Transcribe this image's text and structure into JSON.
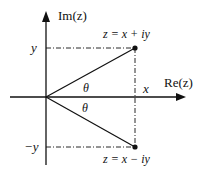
{
  "diagram": {
    "type": "complex-plane-conjugate",
    "axes": {
      "real_label": "Re(z)",
      "imag_label": "Im(z)"
    },
    "points": [
      {
        "label": "z = x + iy",
        "role": "upper"
      },
      {
        "label": "z = x − iy",
        "role": "lower"
      }
    ],
    "ticks": {
      "y_pos": "y",
      "y_neg": "−y",
      "x": "x"
    },
    "angles": {
      "upper": "θ",
      "lower": "θ"
    },
    "colors": {
      "stroke": "#111111",
      "background": "#ffffff"
    }
  }
}
